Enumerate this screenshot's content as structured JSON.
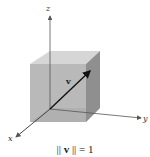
{
  "figure": {
    "axes": {
      "x_label": "x",
      "y_label": "y",
      "z_label": "z"
    },
    "vector_label": "v",
    "caption": {
      "left": "||",
      "vec": "v",
      "right": "|| = 1"
    },
    "colors": {
      "cube_front": "#a9a9a9",
      "cube_top": "#d4d4d4",
      "cube_right": "#8f8f8f",
      "cube_bottom": "#c2c2c2",
      "axis": "#555555",
      "vector": "#111111"
    }
  }
}
